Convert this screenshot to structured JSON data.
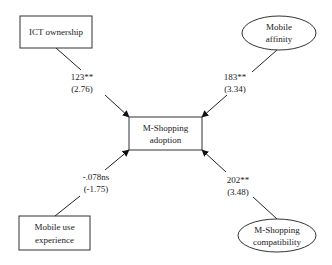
{
  "diagram": {
    "center": {
      "line1": "M-Shopping",
      "line2": "adoption"
    },
    "nodes": {
      "ict": {
        "line1": "ICT ownership",
        "shape": "rectangle"
      },
      "affinity": {
        "line1": "Mobile",
        "line2": "affinity",
        "shape": "ellipse"
      },
      "experience": {
        "line1": "Mobile use",
        "line2": "experience",
        "shape": "rectangle"
      },
      "compat": {
        "line1": "M-Shopping",
        "line2": "compatibility",
        "shape": "ellipse"
      }
    },
    "paths": {
      "ict": {
        "coef": "123**",
        "t": "(2.76)"
      },
      "affinity": {
        "coef": "183**",
        "t": "(3.34)"
      },
      "experience": {
        "coef": "-.078ns",
        "t": "(-1.75)"
      },
      "compat": {
        "coef": "202**",
        "t": "(3.48)"
      }
    },
    "colors": {
      "stroke": "#222222",
      "background": "#ffffff"
    }
  }
}
